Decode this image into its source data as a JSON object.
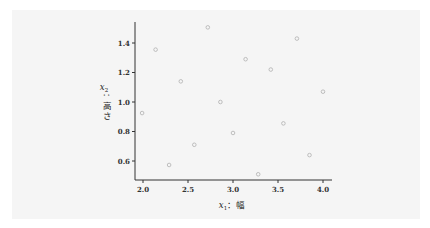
{
  "chart_data": {
    "type": "scatter",
    "title": "",
    "xlabel": "x₁ : 幅",
    "ylabel": "x₂ : 高さ",
    "xlabel_var": "x",
    "xlabel_sub": "1",
    "xlabel_text": "：幅",
    "ylabel_var": "x",
    "ylabel_sub": "2",
    "ylabel_colon": "：",
    "ylabel_text": [
      "高",
      "さ"
    ],
    "xlim": [
      1.97,
      4.1
    ],
    "ylim": [
      0.48,
      1.53
    ],
    "xticks": [
      2.0,
      2.5,
      3.0,
      3.5,
      4.0
    ],
    "xtick_labels": [
      "2.0",
      "2.5",
      "3.0",
      "3.5",
      "4.0"
    ],
    "yticks": [
      0.6,
      0.8,
      1.0,
      1.2,
      1.4
    ],
    "ytick_labels": [
      "0.6",
      "0.8",
      "1.0",
      "1.2",
      "1.4"
    ],
    "grid": false,
    "legend": null,
    "marker_color": "#b0b0b0",
    "series": [
      {
        "name": "points",
        "x": [
          1.99,
          2.14,
          2.29,
          2.42,
          2.57,
          2.72,
          2.86,
          3.0,
          3.14,
          3.28,
          3.42,
          3.56,
          3.71,
          3.85,
          4.0
        ],
        "y": [
          0.925,
          1.355,
          0.573,
          1.14,
          0.71,
          1.506,
          1.0,
          0.79,
          1.29,
          0.51,
          1.22,
          0.855,
          1.43,
          0.64,
          1.07
        ]
      }
    ]
  }
}
